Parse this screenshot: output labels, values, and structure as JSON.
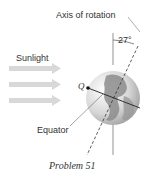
{
  "labels": {
    "axis": "Axis of rotation",
    "angle": "27°",
    "sunlight": "Sunlight",
    "point": "Q",
    "equator": "Equator"
  },
  "caption": "Problem 51",
  "colors": {
    "arrow": "#d9d9d9",
    "globe_light": "#e8e8e8",
    "globe_dark": "#8a8a8a",
    "line": "#555555"
  }
}
